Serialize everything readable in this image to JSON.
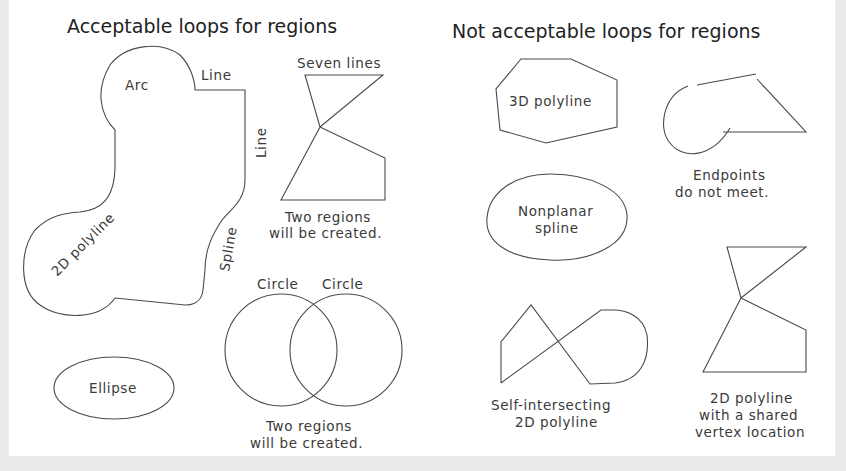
{
  "diagram": {
    "left_panel": {
      "title": "Acceptable loops for regions",
      "labels": {
        "arc": "Arc",
        "line_top": "Line",
        "line_right": "Line",
        "polyline_2d": "2D polyline",
        "spline": "Spline",
        "seven_lines": "Seven lines",
        "two_regions_1a": "Two regions",
        "two_regions_1b": "will be created.",
        "circle_1": "Circle",
        "circle_2": "Circle",
        "ellipse": "Ellipse",
        "two_regions_2a": "Two regions",
        "two_regions_2b": "will be created."
      }
    },
    "right_panel": {
      "title": "Not acceptable loops for regions",
      "labels": {
        "polyline_3d": "3D polyline",
        "endpoints_a": "Endpoints",
        "endpoints_b": "do not meet.",
        "nonplanar_a": "Nonplanar",
        "nonplanar_b": "spline",
        "self_intersecting_a": "Self-intersecting",
        "self_intersecting_b": "2D polyline",
        "shared_vertex_a": "2D polyline",
        "shared_vertex_b": "with a shared",
        "shared_vertex_c": "vertex location"
      }
    },
    "colors": {
      "background": "#ebebeb",
      "canvas": "#ffffff",
      "stroke": "#4a4a4a",
      "text": "#222222"
    }
  }
}
